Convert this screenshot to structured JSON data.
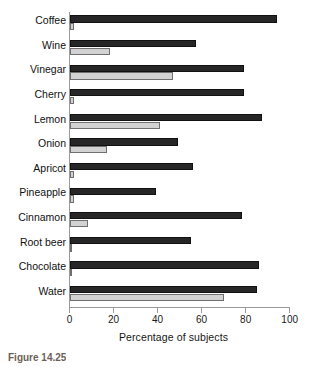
{
  "figure": {
    "caption": "Figure 14.25"
  },
  "chart_data": {
    "type": "bar",
    "orientation": "horizontal",
    "title": "",
    "subtitle": "",
    "xlabel": "Percentage of subjects",
    "ylabel": "",
    "xlim": [
      0,
      100
    ],
    "xticks": [
      0,
      20,
      40,
      60,
      80,
      100
    ],
    "xtick_labels": [
      "0",
      "20",
      "40",
      "60",
      "80",
      "100"
    ],
    "grid": false,
    "legend": false,
    "legend_position": "none",
    "categories": [
      "Coffee",
      "Wine",
      "Vinegar",
      "Cherry",
      "Lemon",
      "Onion",
      "Apricot",
      "Pineapple",
      "Cinnamon",
      "Root beer",
      "Chocolate",
      "Water"
    ],
    "series": [
      {
        "name": "dark",
        "color": "#262626",
        "values": [
          94,
          57,
          79,
          79,
          87,
          49,
          56,
          39,
          78,
          55,
          86,
          85
        ]
      },
      {
        "name": "light",
        "color": "#d2d2d2",
        "values": [
          2,
          18,
          47,
          2,
          41,
          17,
          2,
          2,
          8,
          1,
          1,
          70
        ]
      }
    ]
  }
}
